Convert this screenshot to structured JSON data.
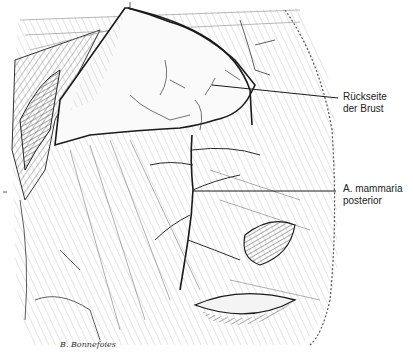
{
  "figure": {
    "type": "anatomical illustration",
    "labels": [
      {
        "line1": "Rückseite",
        "line2": "der Brust"
      },
      {
        "line1": "A. mammaria",
        "line2": "posterior"
      }
    ],
    "signature": "B. Bonnefoies",
    "colors": {
      "ink": "#1a1a1a",
      "background": "#ffffff",
      "hatch": "#777777"
    }
  }
}
